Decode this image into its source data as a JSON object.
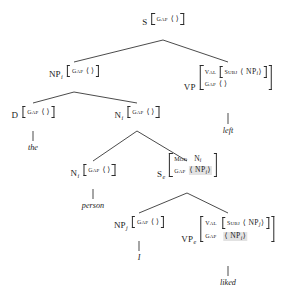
{
  "diagram": {
    "angle_open": "⟨",
    "angle_close": "⟩",
    "empty_list": "⟨ ⟩"
  },
  "nodes": {
    "s_root": {
      "category": "S",
      "subscript": "",
      "features": [
        {
          "name": "GAP",
          "value": "⟨ ⟩",
          "shaded": false
        }
      ]
    },
    "np_i_top": {
      "category": "NP",
      "subscript": "i",
      "features": [
        {
          "name": "GAP",
          "value": "⟨ ⟩",
          "shaded": false
        }
      ]
    },
    "vp_top": {
      "category": "VP",
      "subscript": "",
      "features": [
        {
          "name": "VAL",
          "nested": {
            "name": "SUBJ",
            "value": "⟨ NP",
            "sub": "i",
            "tail": "⟩"
          }
        },
        {
          "name": "GAP",
          "value": "⟨ ⟩",
          "shaded": false
        }
      ]
    },
    "d_node": {
      "category": "D",
      "subscript": "",
      "features": [
        {
          "name": "GAP",
          "value": "⟨ ⟩",
          "shaded": false
        }
      ]
    },
    "n_i_upper": {
      "category": "N",
      "subscript": "i",
      "features": [
        {
          "name": "GAP",
          "value": "⟨ ⟩",
          "shaded": false
        }
      ]
    },
    "n_i_lower": {
      "category": "N",
      "subscript": "i",
      "features": [
        {
          "name": "GAP",
          "value": "⟨ ⟩",
          "shaded": false
        }
      ]
    },
    "s_e": {
      "category": "S",
      "subscript": "e",
      "features": [
        {
          "name": "MOD",
          "value": "N",
          "sub": "i",
          "tail": ""
        },
        {
          "name": "GAP",
          "value": "⟨ NP",
          "sub": "i",
          "tail": "⟩",
          "shaded": true
        }
      ]
    },
    "np_j": {
      "category": "NP",
      "subscript": "j",
      "features": [
        {
          "name": "GAP",
          "value": "⟨ ⟩",
          "shaded": false
        }
      ]
    },
    "vp_e": {
      "category": "VP",
      "subscript": "e",
      "features": [
        {
          "name": "VAL",
          "nested": {
            "name": "SUBJ",
            "value": "⟨ NP",
            "sub": "j",
            "tail": "⟩"
          }
        },
        {
          "name": "GAP",
          "value": "⟨ NP",
          "sub": "i",
          "tail": "⟩",
          "shaded": true
        }
      ]
    }
  },
  "terminals": {
    "the": "the",
    "person": "person",
    "i": "I",
    "liked": "liked",
    "left": "left"
  },
  "colors": {
    "ink": "#1a1a1a",
    "line": "#2b2b2b",
    "shade": "#e2e2e2",
    "background": "#ffffff"
  }
}
